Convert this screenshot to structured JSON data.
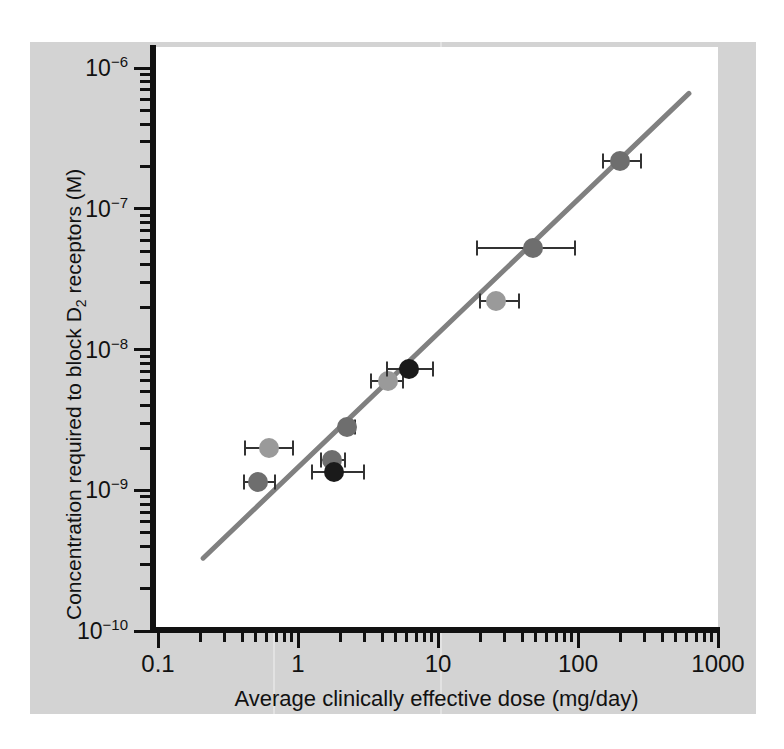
{
  "chart_data": {
    "type": "scatter",
    "title": "",
    "xlabel": "Average clinically effective dose (mg/day)",
    "ylabel": "Concentration required to block D2 receptors (M)",
    "ylabel_html": "Concentration required to block D<sub>2</sub> receptors (M)",
    "xscale": "log",
    "yscale": "log",
    "xlim": [
      0.1,
      1000
    ],
    "ylim": [
      1e-10,
      1e-06
    ],
    "grid": false,
    "legend": null,
    "xticks": [
      "0.1",
      "1",
      "10",
      "100",
      "1000"
    ],
    "xtick_values": [
      0.1,
      1,
      10,
      100,
      1000
    ],
    "yticks": [
      "10-6",
      "10-7",
      "10-8",
      "10-9",
      "10-10"
    ],
    "ytick_exponents": [
      -6,
      -7,
      -8,
      -9,
      -10
    ],
    "ytick_base": "10",
    "points": [
      {
        "x": 0.62,
        "y": 2e-09,
        "xerr_low": 0.42,
        "xerr_high": 0.92,
        "color": "#9a9a9a"
      },
      {
        "x": 0.52,
        "y": 1.15e-09,
        "xerr_low": 0.41,
        "xerr_high": 0.68,
        "color": "#6e6e6e"
      },
      {
        "x": 1.75,
        "y": 1.65e-09,
        "xerr_low": 1.45,
        "xerr_high": 2.15,
        "color": "#6e6e6e"
      },
      {
        "x": 1.8,
        "y": 1.35e-09,
        "xerr_low": 1.25,
        "xerr_high": 2.95,
        "color": "#1a1a1a"
      },
      {
        "x": 2.25,
        "y": 2.8e-09,
        "xerr_low": 2.05,
        "xerr_high": 2.55,
        "color": "#6e6e6e"
      },
      {
        "x": 4.4,
        "y": 6e-09,
        "xerr_low": 3.3,
        "xerr_high": 5.6,
        "color": "#9a9a9a"
      },
      {
        "x": 6.2,
        "y": 7.3e-09,
        "xerr_low": 4.3,
        "xerr_high": 9.2,
        "color": "#1a1a1a"
      },
      {
        "x": 26,
        "y": 2.2e-08,
        "xerr_low": 20,
        "xerr_high": 38,
        "color": "#9a9a9a"
      },
      {
        "x": 48,
        "y": 5.3e-08,
        "xerr_low": 19,
        "xerr_high": 95,
        "color": "#6e6e6e"
      },
      {
        "x": 200,
        "y": 2.2e-07,
        "xerr_low": 150,
        "xerr_high": 280,
        "color": "#6e6e6e"
      }
    ],
    "trendline": {
      "x_start": 0.21,
      "y_start": 3.3e-10,
      "x_end": 620,
      "y_end": 6.6e-07,
      "color": "#808080",
      "width_px": 5
    }
  },
  "colors": {
    "figure_background": "#d3d3d3",
    "plot_background": "#ffffff",
    "axis": "#111111",
    "trendline": "#808080",
    "errorbar": "#333333",
    "marker_light": "#9a9a9a",
    "marker_mid": "#6e6e6e",
    "marker_dark": "#1a1a1a"
  }
}
